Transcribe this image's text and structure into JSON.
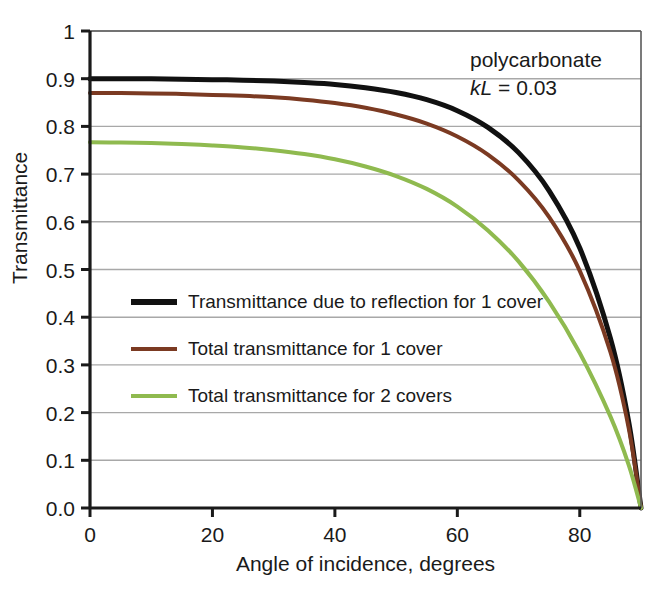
{
  "chart_data": {
    "type": "line",
    "title": "",
    "xlabel": "Angle of incidence, degrees",
    "ylabel": "Transmittance",
    "xlim": [
      0,
      90
    ],
    "ylim": [
      0,
      1
    ],
    "xticks": [
      "0",
      "20",
      "40",
      "60",
      "80"
    ],
    "xtick_values": [
      0,
      20,
      40,
      60,
      80
    ],
    "yticks": [
      "0.0",
      "0.1",
      "0.2",
      "0.3",
      "0.4",
      "0.5",
      "0.6",
      "0.7",
      "0.8",
      "0.9",
      "1"
    ],
    "ytick_values": [
      0,
      0.1,
      0.2,
      0.3,
      0.4,
      0.5,
      0.6,
      0.7,
      0.8,
      0.9,
      1
    ],
    "grid": "horizontal",
    "legend_position": "inside-left-middle",
    "x": [
      0,
      5,
      10,
      15,
      20,
      25,
      30,
      35,
      40,
      45,
      50,
      55,
      60,
      65,
      70,
      75,
      80,
      85,
      88,
      90
    ],
    "series": [
      {
        "name": "Transmittance due to reflection for 1 cover",
        "color": "#111111",
        "width": 5,
        "values": [
          0.9,
          0.9,
          0.9,
          0.899,
          0.898,
          0.897,
          0.895,
          0.892,
          0.888,
          0.881,
          0.871,
          0.856,
          0.833,
          0.798,
          0.745,
          0.665,
          0.545,
          0.356,
          0.18,
          0.0
        ]
      },
      {
        "name": "Total transmittance for 1 cover",
        "color": "#7b3a22",
        "width": 4,
        "values": [
          0.87,
          0.87,
          0.869,
          0.868,
          0.866,
          0.864,
          0.861,
          0.856,
          0.849,
          0.839,
          0.825,
          0.806,
          0.779,
          0.741,
          0.687,
          0.61,
          0.497,
          0.327,
          0.167,
          0.0
        ]
      },
      {
        "name": "Total transmittance for 2 covers",
        "color": "#8fba4f",
        "width": 4,
        "values": [
          0.767,
          0.766,
          0.765,
          0.763,
          0.76,
          0.756,
          0.75,
          0.742,
          0.731,
          0.716,
          0.696,
          0.669,
          0.632,
          0.582,
          0.517,
          0.432,
          0.325,
          0.192,
          0.09,
          0.0
        ]
      }
    ],
    "annotations": [
      {
        "text": "polycarbonate",
        "x_px": 470,
        "y_px": 48
      },
      {
        "text": "kL = 0.03",
        "symbol": "kL",
        "operator": " = ",
        "value": "0.03",
        "x_px": 470,
        "y_px": 76
      }
    ],
    "colors": {
      "axis": "#1a1a1a",
      "grid": "#a8a8a8",
      "background": "#ffffff",
      "series_black": "#111111",
      "series_brown": "#7b3a22",
      "series_green": "#8fba4f"
    }
  },
  "axes": {
    "y_title": "Transmittance",
    "x_title": "Angle of incidence, degrees"
  }
}
